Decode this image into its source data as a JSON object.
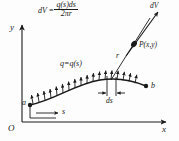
{
  "figure": {
    "title_formula": {
      "lhs": "dV",
      "equals": "=",
      "numerator": "q(s)ds",
      "denominator": "2πr"
    },
    "axes": {
      "y_label": "y",
      "x_label": "x",
      "origin_label": "O"
    },
    "labels": {
      "charge_density": "q=q(s)",
      "point_a": "a",
      "point_b": "b",
      "arc_length": "s",
      "element": "ds",
      "distance": "r",
      "potential": "dV",
      "field_point": "P(x,y)"
    },
    "colors": {
      "ink": "#1a1a1a",
      "background": "#fdfdfd"
    }
  }
}
